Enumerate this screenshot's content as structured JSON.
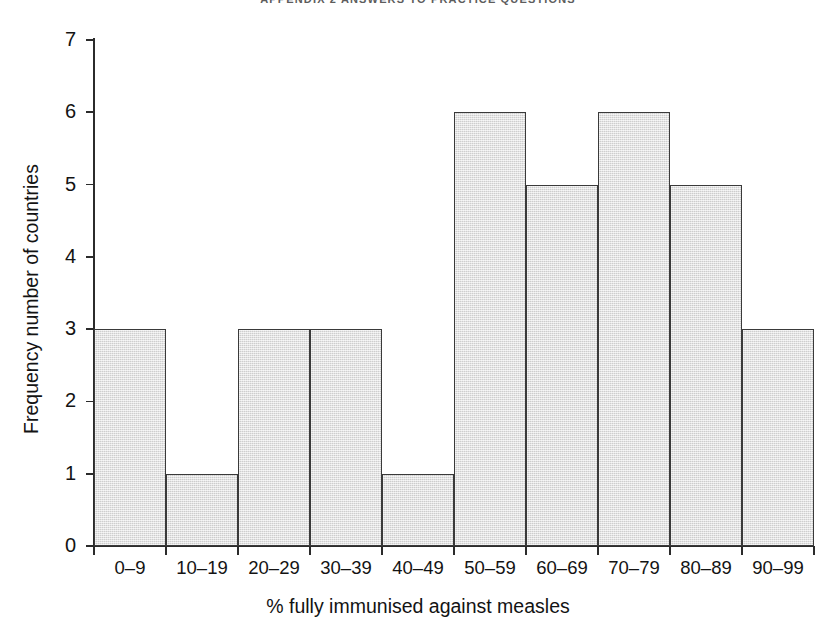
{
  "page": {
    "running_head": "APPENDIX 2 ANSWERS TO PRACTICE QUESTIONS"
  },
  "chart_data": {
    "type": "bar",
    "title": "",
    "subtitle": "",
    "xlabel": "% fully immunised against measles",
    "ylabel": "Frequency number of countries",
    "categories": [
      "0–9",
      "10–19",
      "20–29",
      "30–39",
      "40–49",
      "50–59",
      "60–69",
      "70–79",
      "80–89",
      "90–99"
    ],
    "values": [
      3,
      1,
      3,
      3,
      1,
      6,
      5,
      6,
      5,
      3
    ],
    "ylim": [
      0,
      7
    ],
    "y_ticks": [
      0,
      1,
      2,
      3,
      4,
      5,
      6,
      7
    ],
    "y_tick_labels": [
      "0",
      "1",
      "2",
      "3",
      "4",
      "5",
      "6",
      "7"
    ],
    "grid": false,
    "legend": false,
    "legend_position": "none",
    "bar_gap": 0,
    "colors": {
      "bar_fill": "#dcdcdc",
      "bar_edge": "#3a3a3a",
      "axis": "#2b2b2b",
      "text": "#131313",
      "running_head": "#5d5d5d",
      "background": "#ffffff"
    }
  }
}
